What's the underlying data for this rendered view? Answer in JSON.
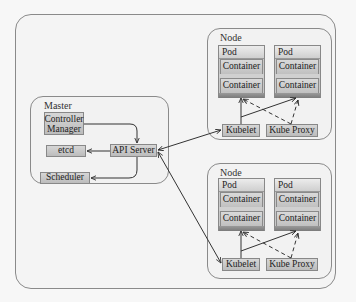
{
  "diagram": {
    "master": {
      "label": "Master",
      "controller_manager": {
        "line1": "Controller",
        "line2": "Manager"
      },
      "etcd": "etcd",
      "api_server": "API Server",
      "scheduler": "Scheduler"
    },
    "nodes": [
      {
        "label": "Node",
        "pods": [
          {
            "label": "Pod",
            "containers": [
              "Container",
              "Container"
            ]
          },
          {
            "label": "Pod",
            "containers": [
              "Container",
              "Container"
            ]
          }
        ],
        "kubelet": "Kubelet",
        "kube_proxy": "Kube Proxy"
      },
      {
        "label": "Node",
        "pods": [
          {
            "label": "Pod",
            "containers": [
              "Container",
              "Container"
            ]
          },
          {
            "label": "Pod",
            "containers": [
              "Container",
              "Container"
            ]
          }
        ],
        "kubelet": "Kubelet",
        "kube_proxy": "Kube Proxy"
      }
    ],
    "connections": [
      {
        "from": "Controller Manager",
        "to": "API Server",
        "style": "solid"
      },
      {
        "from": "API Server",
        "to": "etcd",
        "style": "solid"
      },
      {
        "from": "API Server",
        "to": "Scheduler",
        "style": "solid"
      },
      {
        "from": "API Server",
        "to": "Kubelet (Node 1)",
        "style": "solid",
        "bidirectional": true
      },
      {
        "from": "API Server",
        "to": "Kubelet (Node 2)",
        "style": "solid",
        "bidirectional": true
      },
      {
        "from": "Kubelet",
        "to": "Pod 1",
        "style": "solid"
      },
      {
        "from": "Kubelet",
        "to": "Pod 2",
        "style": "solid"
      },
      {
        "from": "Kube Proxy",
        "to": "Pod 1",
        "style": "dashed"
      },
      {
        "from": "Kube Proxy",
        "to": "Pod 2",
        "style": "dashed"
      }
    ],
    "colors": {
      "component_fill": "#c8c8c8",
      "border": "#8a8a8a",
      "background": "#f4f4f4"
    }
  }
}
